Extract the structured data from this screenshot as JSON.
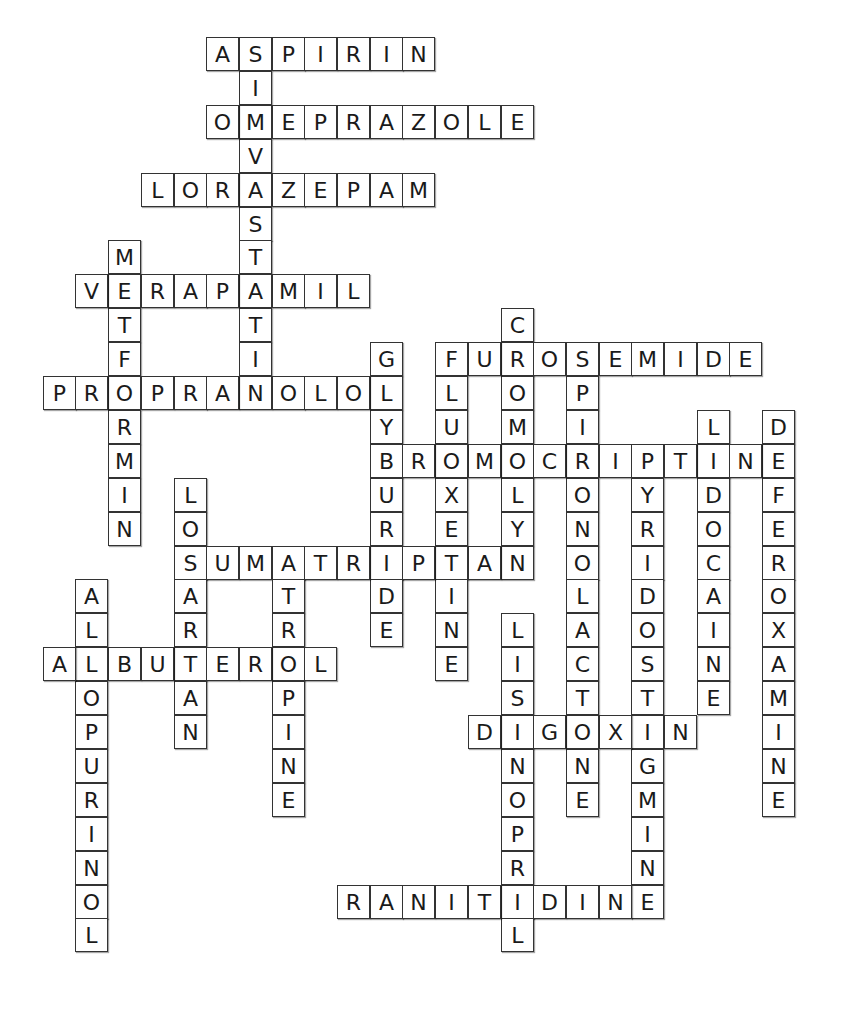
{
  "puzzle": {
    "type": "crossword-solution",
    "grid": {
      "origin_x": 10,
      "origin_y": 37,
      "cell_w": 32.7,
      "cell_h": 33.9
    },
    "words": [
      {
        "word": "ASPIRIN",
        "dir": "across",
        "row": 0,
        "col": 6
      },
      {
        "word": "SIMVASTATIN",
        "dir": "down",
        "row": 0,
        "col": 7
      },
      {
        "word": "OMEPRAZOLE",
        "dir": "across",
        "row": 2,
        "col": 6
      },
      {
        "word": "LORAZEPAM",
        "dir": "across",
        "row": 4,
        "col": 4
      },
      {
        "word": "METFORMIN",
        "dir": "down",
        "row": 6,
        "col": 3
      },
      {
        "word": "VERAPAMIL",
        "dir": "across",
        "row": 7,
        "col": 2
      },
      {
        "word": "CROMOLYN",
        "dir": "down",
        "row": 8,
        "col": 15
      },
      {
        "word": "GLYBURIDE",
        "dir": "down",
        "row": 9,
        "col": 11
      },
      {
        "word": "FLUOXETINE",
        "dir": "down",
        "row": 9,
        "col": 13
      },
      {
        "word": "FUROSEMIDE",
        "dir": "across",
        "row": 9,
        "col": 13
      },
      {
        "word": "SPIRONOLACTONE",
        "dir": "down",
        "row": 9,
        "col": 17
      },
      {
        "word": "PROPRANOLOL",
        "dir": "across",
        "row": 10,
        "col": 1
      },
      {
        "word": "LIDOCAINE",
        "dir": "down",
        "row": 11,
        "col": 21
      },
      {
        "word": "DEFEROXAMINE",
        "dir": "down",
        "row": 11,
        "col": 23
      },
      {
        "word": "BROMOCRIPTINE",
        "dir": "across",
        "row": 12,
        "col": 11
      },
      {
        "word": "PYRIDOSTIGMINE",
        "dir": "down",
        "row": 12,
        "col": 19
      },
      {
        "word": "LOSARTAN",
        "dir": "down",
        "row": 13,
        "col": 5
      },
      {
        "word": "SUMATRIPTAN",
        "dir": "across",
        "row": 15,
        "col": 5
      },
      {
        "word": "ATROPINE",
        "dir": "down",
        "row": 15,
        "col": 8
      },
      {
        "word": "ALLOPURINOL",
        "dir": "down",
        "row": 16,
        "col": 2
      },
      {
        "word": "LISINOPRIL",
        "dir": "down",
        "row": 17,
        "col": 15
      },
      {
        "word": "ALBUTEROL",
        "dir": "across",
        "row": 18,
        "col": 1
      },
      {
        "word": "DIGOXIN",
        "dir": "across",
        "row": 20,
        "col": 14
      },
      {
        "word": "RANITIDINE",
        "dir": "across",
        "row": 25,
        "col": 10
      }
    ]
  }
}
